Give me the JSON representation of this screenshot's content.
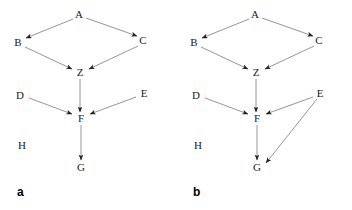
{
  "figure": {
    "background_color": "#ffffff",
    "edge_color": "#7a7a7a",
    "node_text_color": "#1a1a1a",
    "caption_color": "#000000"
  },
  "panels": [
    {
      "id": "a",
      "caption": "a",
      "caption_x": 17,
      "caption_y": 186,
      "nodes": [
        {
          "id": "A",
          "label": "A",
          "x": 79,
          "y": 14
        },
        {
          "id": "B",
          "label": "B",
          "x": 18,
          "y": 42
        },
        {
          "id": "C",
          "label": "C",
          "x": 143,
          "y": 40
        },
        {
          "id": "Z",
          "label": "Z",
          "x": 80,
          "y": 72
        },
        {
          "id": "D",
          "label": "D",
          "x": 20,
          "y": 95
        },
        {
          "id": "E",
          "label": "E",
          "x": 144,
          "y": 93
        },
        {
          "id": "F",
          "label": "F",
          "x": 81,
          "y": 118
        },
        {
          "id": "H",
          "label": "H",
          "x": 22,
          "y": 145
        },
        {
          "id": "G",
          "label": "G",
          "x": 81,
          "y": 167
        }
      ],
      "edges": [
        {
          "from": "A",
          "to": "B",
          "x1": 73,
          "y1": 19,
          "x2": 26,
          "y2": 38
        },
        {
          "from": "A",
          "to": "C",
          "x1": 86,
          "y1": 18,
          "x2": 137,
          "y2": 36
        },
        {
          "from": "B",
          "to": "Z",
          "x1": 25,
          "y1": 47,
          "x2": 72,
          "y2": 69
        },
        {
          "from": "C",
          "to": "Z",
          "x1": 138,
          "y1": 46,
          "x2": 89,
          "y2": 69
        },
        {
          "from": "Z",
          "to": "F",
          "x1": 80,
          "y1": 79,
          "x2": 80,
          "y2": 112
        },
        {
          "from": "D",
          "to": "F",
          "x1": 29,
          "y1": 98,
          "x2": 72,
          "y2": 114
        },
        {
          "from": "E",
          "to": "F",
          "x1": 136,
          "y1": 97,
          "x2": 90,
          "y2": 114
        },
        {
          "from": "F",
          "to": "G",
          "x1": 81,
          "y1": 125,
          "x2": 81,
          "y2": 160
        }
      ]
    },
    {
      "id": "b",
      "caption": "b",
      "caption_x": 17,
      "caption_y": 186,
      "nodes": [
        {
          "id": "A",
          "label": "A",
          "x": 79,
          "y": 14
        },
        {
          "id": "B",
          "label": "B",
          "x": 18,
          "y": 42
        },
        {
          "id": "C",
          "label": "C",
          "x": 143,
          "y": 40
        },
        {
          "id": "Z",
          "label": "Z",
          "x": 80,
          "y": 72
        },
        {
          "id": "D",
          "label": "D",
          "x": 20,
          "y": 95
        },
        {
          "id": "E",
          "label": "E",
          "x": 144,
          "y": 93
        },
        {
          "id": "F",
          "label": "F",
          "x": 81,
          "y": 118
        },
        {
          "id": "H",
          "label": "H",
          "x": 22,
          "y": 145
        },
        {
          "id": "G",
          "label": "G",
          "x": 81,
          "y": 167
        }
      ],
      "edges": [
        {
          "from": "A",
          "to": "B",
          "x1": 73,
          "y1": 19,
          "x2": 26,
          "y2": 38
        },
        {
          "from": "A",
          "to": "C",
          "x1": 86,
          "y1": 18,
          "x2": 137,
          "y2": 36
        },
        {
          "from": "B",
          "to": "Z",
          "x1": 25,
          "y1": 47,
          "x2": 72,
          "y2": 69
        },
        {
          "from": "C",
          "to": "Z",
          "x1": 138,
          "y1": 46,
          "x2": 89,
          "y2": 69
        },
        {
          "from": "Z",
          "to": "F",
          "x1": 80,
          "y1": 79,
          "x2": 80,
          "y2": 112
        },
        {
          "from": "D",
          "to": "F",
          "x1": 29,
          "y1": 98,
          "x2": 72,
          "y2": 114
        },
        {
          "from": "E",
          "to": "F",
          "x1": 137,
          "y1": 97,
          "x2": 90,
          "y2": 114
        },
        {
          "from": "E",
          "to": "G",
          "x1": 141,
          "y1": 99,
          "x2": 90,
          "y2": 163
        },
        {
          "from": "F",
          "to": "G",
          "x1": 81,
          "y1": 125,
          "x2": 81,
          "y2": 160
        }
      ]
    }
  ]
}
